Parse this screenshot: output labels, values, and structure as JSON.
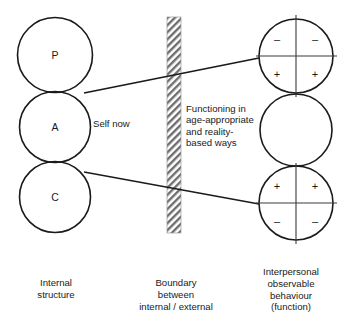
{
  "figure": {
    "left_column": {
      "circles": [
        {
          "name": "parent-ego-state",
          "label": "P"
        },
        {
          "name": "adult-ego-state",
          "label": "A"
        },
        {
          "name": "child-ego-state",
          "label": "C"
        }
      ],
      "caption": "Internal\nstructure"
    },
    "boundary": {
      "name": "hatched-boundary-band",
      "caption": "Boundary\nbetween\ninternal / external"
    },
    "center_note": "Functioning in\nage-appropriate\nand reality-\nbased ways",
    "self_now_label": "Self now",
    "right_column": {
      "circles": [
        {
          "name": "upper-function-circle",
          "quadrants": {
            "top_left": "–",
            "top_right": "–",
            "bottom_left": "+",
            "bottom_right": "+"
          }
        },
        {
          "name": "middle-function-circle",
          "quadrants": null
        },
        {
          "name": "lower-function-circle",
          "quadrants": {
            "top_left": "+",
            "top_right": "+",
            "bottom_left": "–",
            "bottom_right": "–"
          }
        }
      ],
      "caption": "Interpersonal\nobservable\nbehaviour\n(function)"
    },
    "colors": {
      "stroke": "#1a1a1a",
      "quadrant_stroke": "#3a3a3a",
      "background": "#ffffff",
      "hatch": "#6e6e6e"
    }
  }
}
